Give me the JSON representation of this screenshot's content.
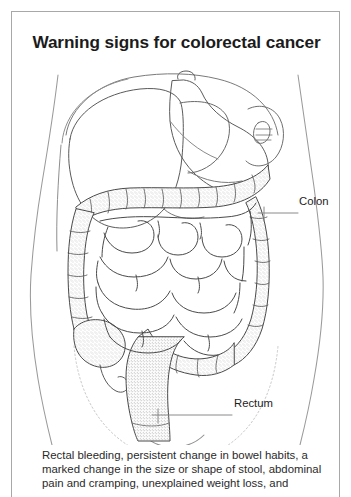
{
  "card": {
    "title": "Warning signs for colorectal cancer",
    "border_color": "#a8a8a8",
    "background": "#ffffff"
  },
  "illustration": {
    "name": "colorectal-anatomy-diagram",
    "description": "Line drawing of a human torso showing the digestive organs: liver, stomach, large intestine (colon), small intestine, cecum with appendix, and rectum",
    "line_color": "#3c3c3c",
    "stipple_color": "#8a8a8a",
    "labels": [
      {
        "id": "colon",
        "text": "Colon"
      },
      {
        "id": "rectum",
        "text": "Rectum"
      }
    ]
  },
  "body_text": {
    "lines": [
      "Rectal bleeding, persistent change in bowel habits, a",
      "marked change in the size or shape of stool, abdominal",
      "pain and cramping, unexplained weight loss, and"
    ]
  }
}
